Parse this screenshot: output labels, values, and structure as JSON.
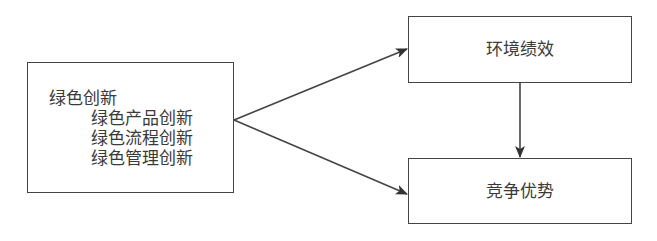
{
  "diagram": {
    "nodes": {
      "green_innovation": {
        "title": "绿色创新",
        "subitems": [
          "绿色产品创新",
          "绿色流程创新",
          "绿色管理创新"
        ]
      },
      "environmental_performance": {
        "label": "环境绩效"
      },
      "competitive_advantage": {
        "label": "竞争优势"
      }
    },
    "edges": [
      {
        "from": "绿色创新",
        "to": "环境绩效"
      },
      {
        "from": "绿色创新",
        "to": "竞争优势"
      },
      {
        "from": "环境绩效",
        "to": "竞争优势"
      }
    ],
    "colors": {
      "stroke": "#444444",
      "text": "#3a3a3a",
      "background": "#ffffff"
    }
  }
}
